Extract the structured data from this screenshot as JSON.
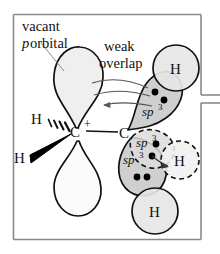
{
  "figure": {
    "panel": {
      "border_color": "#8a8a8a",
      "background": "#ffffff"
    },
    "colors": {
      "outline": "#111111",
      "p_orbital_fill": "#efefef",
      "p_orbital_lower_fill": "#fbfbfb",
      "sp3_fill": "#cfcfcf",
      "sp3_dashed_fill": "#dcdcdc",
      "h_circle_fill": "#e6e6e6",
      "h_circle_dashed_fill": "#f0f0f0",
      "electron_dot": "#000000",
      "arrow": "#555555",
      "leader_line": "#888888"
    },
    "labels": {
      "vacant": "vacant",
      "p_italic": "p",
      "orbital": " orbital",
      "weak": "weak",
      "overlap": "overlap",
      "sp3_base": "sp",
      "sp3_exp": "3",
      "carbon_left": "C",
      "carbon_right": "C",
      "plus_charge": "+",
      "hydrogen": "H"
    },
    "atoms": {
      "cation_carbon": {
        "label": "C",
        "charge": "+",
        "x": 76,
        "y": 131
      },
      "beta_carbon": {
        "label": "C",
        "x": 126,
        "y": 132
      },
      "h_hashed": {
        "label": "H",
        "x": 36,
        "y": 119
      },
      "h_wedge": {
        "label": "H",
        "x": 19,
        "y": 157
      },
      "h_top_right": {
        "label": "H",
        "x": 176,
        "y": 68
      },
      "h_bottom": {
        "label": "H",
        "x": 155,
        "y": 211
      },
      "h_dashed": {
        "label": "H",
        "x": 180,
        "y": 160
      }
    },
    "orbitals": [
      {
        "name": "vacant-p-upper-lobe",
        "type": "p",
        "style": "solid",
        "electrons": 0
      },
      {
        "name": "vacant-p-lower-lobe",
        "type": "p",
        "style": "solid",
        "electrons": 0
      },
      {
        "name": "sp3-upper",
        "type": "sp3",
        "label": "sp3",
        "style": "solid",
        "electrons": 2
      },
      {
        "name": "sp3-lower-left",
        "type": "sp3",
        "label": "sp3",
        "style": "solid",
        "electrons": 2
      },
      {
        "name": "sp3-dashed",
        "type": "sp3",
        "label": "sp3",
        "style": "dashed",
        "electrons": 2
      }
    ],
    "annotations": [
      {
        "name": "vacant-p-orbital-callout",
        "text": "vacant p orbital"
      },
      {
        "name": "weak-overlap-callout",
        "text": "weak overlap"
      }
    ]
  }
}
